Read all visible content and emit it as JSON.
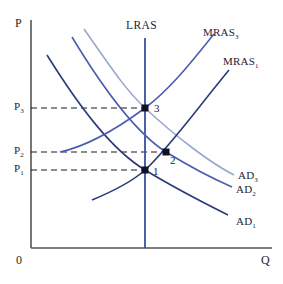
{
  "figure": {
    "type": "economics-ad-as-diagram",
    "background": "#ffffff",
    "axes": {
      "y_label": "P",
      "x_label": "Q",
      "origin_label": "0",
      "axis_color": "#555555",
      "x_axis": {
        "x0": 31,
        "x1": 272,
        "y": 248
      },
      "y_axis": {
        "x": 31,
        "y0": 20,
        "y1": 248
      }
    },
    "price_ticks": [
      {
        "id": "p3",
        "label": "P",
        "sub": "3",
        "y": 108,
        "dash_to_x": 145
      },
      {
        "id": "p2",
        "label": "P",
        "sub": "2",
        "y": 152,
        "dash_to_x": 166
      },
      {
        "id": "p1",
        "label": "P",
        "sub": "1",
        "y": 170,
        "dash_to_x": 145
      }
    ],
    "lras": {
      "label": "LRAS",
      "x": 145,
      "y_top": 38,
      "y_bottom": 248,
      "color": "#3b4f9e",
      "label_x": 126,
      "label_y": 20
    },
    "curves": [
      {
        "id": "ad1",
        "label": "AD",
        "sub": "1",
        "color": "#2b3a7a",
        "width": 1.6,
        "label_x": 236,
        "label_y": 216,
        "path": "M47,55 C80,108 112,150 145,170 C178,190 208,205 228,215"
      },
      {
        "id": "ad2",
        "label": "AD",
        "sub": "2",
        "color": "#4a5db0",
        "width": 1.6,
        "label_x": 236,
        "label_y": 184,
        "path": "M72,37 C104,90 136,133 166,152 C192,168 216,180 232,187"
      },
      {
        "id": "ad3",
        "label": "AD",
        "sub": "3",
        "color": "#9aa8cf",
        "width": 1.6,
        "label_x": 238,
        "label_y": 170,
        "path": "M84,29 C114,72 126,90 145,108 C176,137 212,164 234,175"
      },
      {
        "id": "mras1",
        "label": "MRAS",
        "sub": "1",
        "color": "#2b3a7a",
        "width": 1.6,
        "label_x": 223,
        "label_y": 56,
        "path": "M92,200 C116,190 134,180 145,170 C168,149 196,110 229,70"
      },
      {
        "id": "mras3",
        "label": "MRAS",
        "sub": "3",
        "color": "#4a5db0",
        "width": 1.6,
        "label_x": 203,
        "label_y": 27,
        "path": "M60,152 C88,146 118,128 145,108 C172,88 196,56 214,34"
      }
    ],
    "equilibria": [
      {
        "id": "point-1",
        "label": "1",
        "x": 145,
        "y": 170,
        "label_x": 153,
        "label_y": 166
      },
      {
        "id": "point-2",
        "label": "2",
        "x": 166,
        "y": 152,
        "label_x": 170,
        "label_y": 155
      },
      {
        "id": "point-3",
        "label": "3",
        "x": 145,
        "y": 108,
        "label_x": 154,
        "label_y": 103
      }
    ],
    "colors": {
      "dark_navy": "#2b3a7a",
      "mid_blue": "#4a5db0",
      "light_blue": "#9aa8cf",
      "lras_blue": "#3b4f9e",
      "axis_gray": "#555555",
      "dash_black": "#1a1a1a"
    }
  }
}
